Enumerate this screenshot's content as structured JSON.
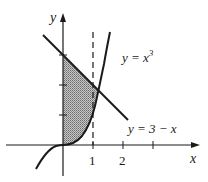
{
  "diagram": {
    "type": "function-graph-shaded-region",
    "axes": {
      "x_label": "x",
      "y_label": "y",
      "x_ticks": [
        "1",
        "2"
      ],
      "x_tick_count": 3,
      "y_tick_count": 2
    },
    "curves": [
      {
        "name": "cubic",
        "label": "y = x³",
        "label_base": "y = x",
        "label_exp": "3"
      },
      {
        "name": "line",
        "label": "y = 3 − x"
      }
    ],
    "dashed_line": {
      "x": 1
    },
    "shaded_region": {
      "description": "Region between x = 0 and the curves, bounded below by y = x³ and above by y = 3 − x"
    },
    "colors": {
      "ink": "#1a1a1a",
      "shade": "#9a9a9a",
      "background": "#ffffff"
    }
  }
}
